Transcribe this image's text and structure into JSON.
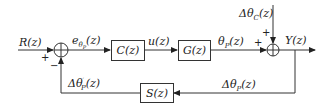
{
  "diagram": {
    "type": "feedback control block diagram",
    "input_label": "R(z)",
    "error_label": "eθP(z)",
    "control_label": "u(z)",
    "plant_output_label": "θP(z)",
    "disturbance_label": "ΔθC(z)",
    "output_label": "Y(z)",
    "feedback_label": "ΔθP(z)",
    "sensor_output_label": "Δθ'P(z)",
    "blocks": [
      {
        "id": "controller",
        "label": "C(z)"
      },
      {
        "id": "plant",
        "label": "G(z)"
      },
      {
        "id": "sensor",
        "label": "S(z)"
      }
    ],
    "summing_junctions": [
      {
        "id": "left-sum",
        "signs": {
          "input": "+",
          "feedback": "−"
        }
      },
      {
        "id": "right-sum",
        "signs": {
          "plant": "+",
          "disturbance": "+"
        }
      }
    ],
    "colors": {
      "line": "#333333",
      "text": "#222222",
      "background": "#ffffff"
    }
  }
}
